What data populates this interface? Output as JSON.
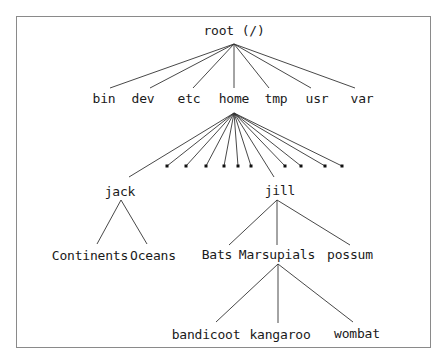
{
  "diagram": {
    "root": {
      "label": "root (/)",
      "x": 234,
      "y": 30
    },
    "level1": [
      {
        "label": "bin",
        "x": 104,
        "y": 98
      },
      {
        "label": "dev",
        "x": 143,
        "y": 98
      },
      {
        "label": "etc",
        "x": 189,
        "y": 98
      },
      {
        "label": "home",
        "x": 234,
        "y": 98
      },
      {
        "label": "tmp",
        "x": 276,
        "y": 98
      },
      {
        "label": "usr",
        "x": 317,
        "y": 98
      },
      {
        "label": "var",
        "x": 362,
        "y": 98
      }
    ],
    "home_users": [
      {
        "label": "jack",
        "x": 120,
        "y": 191
      },
      {
        "label": "jill",
        "x": 280,
        "y": 190
      }
    ],
    "jack_children": [
      {
        "label": "Continents",
        "x": 90,
        "y": 255
      },
      {
        "label": "Oceans",
        "x": 153,
        "y": 255
      }
    ],
    "jill_children": [
      {
        "label": "Bats",
        "x": 217,
        "y": 254
      },
      {
        "label": "Marsupials",
        "x": 277,
        "y": 254
      },
      {
        "label": "possum",
        "x": 350,
        "y": 254
      }
    ],
    "marsupials_children": [
      {
        "label": "bandicoot",
        "x": 206,
        "y": 334
      },
      {
        "label": "kangaroo",
        "x": 280,
        "y": 334
      },
      {
        "label": "wombat",
        "x": 357,
        "y": 333
      }
    ],
    "other_user_markers": [
      167,
      186,
      206,
      224,
      238,
      251,
      285,
      301,
      325,
      342
    ]
  }
}
